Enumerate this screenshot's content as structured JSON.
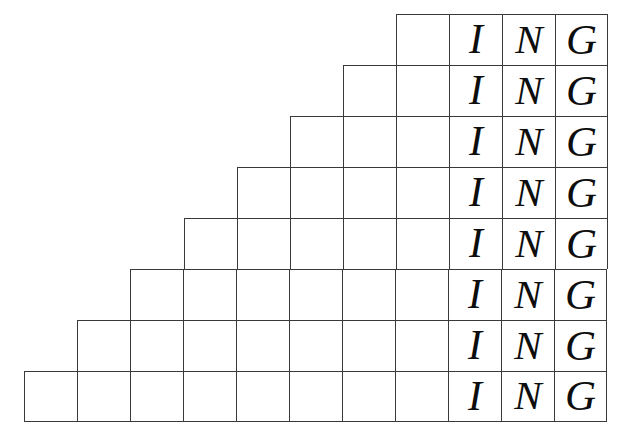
{
  "figure": {
    "type": "grid-staircase",
    "canvas": {
      "width": 621,
      "height": 436,
      "background": "#ffffff"
    },
    "style": {
      "line_color": "#3a3a3a",
      "line_width_px": 1.4,
      "text_color": "#0d0d0d",
      "cell_width_px": 53,
      "cell_height_px": 51,
      "grid_right_edge_px": 607,
      "grid_top_edge_px": 14,
      "grid_bottom_edge_px": 422
    },
    "word": "ING",
    "letters": [
      "I",
      "N",
      "G"
    ],
    "row_count": 8,
    "max_columns": 11,
    "min_columns": 4,
    "rows": [
      {
        "index": 1,
        "columns": 4,
        "left_px": 396,
        "top_px": 14,
        "blank_cells": 1,
        "cells": [
          "",
          "I",
          "N",
          "G"
        ]
      },
      {
        "index": 2,
        "columns": 5,
        "left_px": 343,
        "top_px": 65,
        "blank_cells": 2,
        "cells": [
          "",
          "",
          "I",
          "N",
          "G"
        ]
      },
      {
        "index": 3,
        "columns": 6,
        "left_px": 290,
        "top_px": 116,
        "blank_cells": 3,
        "cells": [
          "",
          "",
          "",
          "I",
          "N",
          "G"
        ]
      },
      {
        "index": 4,
        "columns": 7,
        "left_px": 237,
        "top_px": 167,
        "blank_cells": 4,
        "cells": [
          "",
          "",
          "",
          "",
          "I",
          "N",
          "G"
        ]
      },
      {
        "index": 5,
        "columns": 8,
        "left_px": 184,
        "top_px": 218,
        "blank_cells": 5,
        "cells": [
          "",
          "",
          "",
          "",
          "",
          "I",
          "N",
          "G"
        ]
      },
      {
        "index": 6,
        "columns": 9,
        "left_px": 130,
        "top_px": 269,
        "blank_cells": 6,
        "cells": [
          "",
          "",
          "",
          "",
          "",
          "",
          "I",
          "N",
          "G"
        ]
      },
      {
        "index": 7,
        "columns": 10,
        "left_px": 77,
        "top_px": 320,
        "blank_cells": 7,
        "cells": [
          "",
          "",
          "",
          "",
          "",
          "",
          "",
          "I",
          "N",
          "G"
        ]
      },
      {
        "index": 8,
        "columns": 11,
        "left_px": 24,
        "top_px": 371,
        "blank_cells": 8,
        "cells": [
          "",
          "",
          "",
          "",
          "",
          "",
          "",
          "",
          "I",
          "N",
          "G"
        ]
      }
    ]
  }
}
